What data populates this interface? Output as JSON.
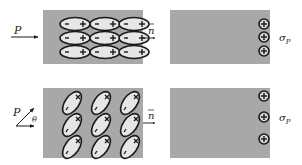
{
  "diagram": {
    "colors": {
      "slab": "#a8a8a8",
      "dipole_fill": "#e6e6e6",
      "stroke": "#1a1a1a",
      "background": "#ffffff"
    },
    "top_row": {
      "polarization_label": "P",
      "normal_label": "n",
      "surface_charge_label": "σ",
      "surface_charge_subscript": "P",
      "dipole_orientation": "horizontal",
      "dipole_grid": {
        "rows": 3,
        "cols": 3
      },
      "dipole_negative_symbol": "−",
      "dipole_positive_symbol": "+",
      "surface_charges": [
        "⊕",
        "⊕",
        "⊕"
      ]
    },
    "bottom_row": {
      "polarization_label": "P",
      "angle_label": "θ",
      "normal_label": "n",
      "surface_charge_label": "σ",
      "surface_charge_subscript": "P",
      "dipole_orientation": "tilted",
      "dipole_grid": {
        "rows": 3,
        "cols": 3
      },
      "dipole_negative_symbol": "−",
      "dipole_positive_symbol": "×",
      "surface_charges": [
        "⊕",
        "⊕",
        "⊕"
      ]
    }
  }
}
